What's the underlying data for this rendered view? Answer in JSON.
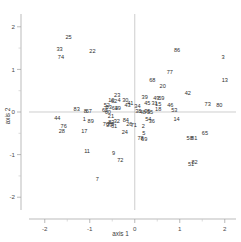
{
  "chart_data": {
    "type": "scatter",
    "title": "",
    "subtitle": "",
    "xlabel": "axis 1",
    "ylabel": "axis 2",
    "xlim": [
      -2.35,
      2.25
    ],
    "ylim": [
      -2.3,
      2.3
    ],
    "xticks": [
      -2,
      -1,
      0,
      1,
      2
    ],
    "xticklabels": [
      "-2",
      "-1",
      "0",
      "1",
      "2"
    ],
    "yticks": [
      -2,
      -1,
      0,
      1,
      2
    ],
    "yticklabels": [
      "-2",
      "-1",
      "0",
      "1",
      "2"
    ],
    "grid": false,
    "legend": null,
    "marker": "text-label",
    "note": "Ordination-style scatter where each observation is drawn as its numeric id label; dense overlapping cluster near origin.",
    "points": [
      {
        "label": "25",
        "x": -1.47,
        "y": 1.76
      },
      {
        "label": "33",
        "x": -1.67,
        "y": 1.48
      },
      {
        "label": "74",
        "x": -1.64,
        "y": 1.29
      },
      {
        "label": "22",
        "x": -0.94,
        "y": 1.44
      },
      {
        "label": "86",
        "x": 0.94,
        "y": 1.45
      },
      {
        "label": "3",
        "x": 1.96,
        "y": 1.3
      },
      {
        "label": "77",
        "x": 0.78,
        "y": 0.93
      },
      {
        "label": "13",
        "x": 2.0,
        "y": 0.76
      },
      {
        "label": "68",
        "x": 0.39,
        "y": 0.75
      },
      {
        "label": "20",
        "x": 0.62,
        "y": 0.6
      },
      {
        "label": "42",
        "x": 1.18,
        "y": 0.44
      },
      {
        "label": "23",
        "x": -0.39,
        "y": 0.4
      },
      {
        "label": "39",
        "x": 0.22,
        "y": 0.35
      },
      {
        "label": "49",
        "x": 0.48,
        "y": 0.34
      },
      {
        "label": "59",
        "x": 0.59,
        "y": 0.33
      },
      {
        "label": "10",
        "x": -0.52,
        "y": 0.27
      },
      {
        "label": "62",
        "x": -0.46,
        "y": 0.25
      },
      {
        "label": "4",
        "x": -0.35,
        "y": 0.28
      },
      {
        "label": "30",
        "x": -0.21,
        "y": 0.27
      },
      {
        "label": "41",
        "x": -0.1,
        "y": 0.22
      },
      {
        "label": "45",
        "x": 0.28,
        "y": 0.22
      },
      {
        "label": "31",
        "x": 0.44,
        "y": 0.21
      },
      {
        "label": "15",
        "x": 0.52,
        "y": 0.18
      },
      {
        "label": "46",
        "x": 0.79,
        "y": 0.17
      },
      {
        "label": "73",
        "x": 1.62,
        "y": 0.19
      },
      {
        "label": "80",
        "x": 1.88,
        "y": 0.16
      },
      {
        "label": "43",
        "x": -0.16,
        "y": 0.16
      },
      {
        "label": "34",
        "x": 0.06,
        "y": 0.13
      },
      {
        "label": "52",
        "x": -0.62,
        "y": 0.17
      },
      {
        "label": "63",
        "x": -0.58,
        "y": 0.11
      },
      {
        "label": "64",
        "x": -0.44,
        "y": 0.1
      },
      {
        "label": "19",
        "x": -0.38,
        "y": 0.09
      },
      {
        "label": "83",
        "x": -1.29,
        "y": 0.08
      },
      {
        "label": "8",
        "x": -1.1,
        "y": 0.03
      },
      {
        "label": "67",
        "x": -1.02,
        "y": 0.02
      },
      {
        "label": "60",
        "x": -0.6,
        "y": 0.0
      },
      {
        "label": "65x",
        "x": -0.66,
        "y": 0.04
      },
      {
        "label": "18",
        "x": 0.52,
        "y": 0.07
      },
      {
        "label": "53",
        "x": 0.88,
        "y": 0.05
      },
      {
        "label": "38",
        "x": 0.08,
        "y": 0.02
      },
      {
        "label": "48",
        "x": 0.18,
        "y": 0.01
      },
      {
        "label": "55",
        "x": 0.34,
        "y": 0.01
      },
      {
        "label": "35",
        "x": 0.28,
        "y": 0.03
      },
      {
        "label": "44",
        "x": -1.72,
        "y": -0.15
      },
      {
        "label": "1",
        "x": -1.12,
        "y": -0.17
      },
      {
        "label": "89",
        "x": -0.98,
        "y": -0.22
      },
      {
        "label": "21",
        "x": -0.53,
        "y": -0.1
      },
      {
        "label": "14",
        "x": 0.93,
        "y": -0.17
      },
      {
        "label": "84",
        "x": -0.2,
        "y": -0.18
      },
      {
        "label": "32",
        "x": -0.4,
        "y": -0.21
      },
      {
        "label": "83b",
        "x": -0.52,
        "y": -0.23
      },
      {
        "label": "70",
        "x": -0.64,
        "y": -0.27
      },
      {
        "label": "75",
        "x": -0.53,
        "y": -0.28
      },
      {
        "label": "37",
        "x": -0.57,
        "y": -0.31
      },
      {
        "label": "61",
        "x": -0.46,
        "y": -0.32
      },
      {
        "label": "36",
        "x": 0.38,
        "y": -0.22
      },
      {
        "label": "54",
        "x": 0.3,
        "y": -0.16
      },
      {
        "label": "26",
        "x": -0.12,
        "y": -0.28
      },
      {
        "label": "71",
        "x": -0.02,
        "y": -0.31
      },
      {
        "label": "2",
        "x": 0.19,
        "y": -0.34
      },
      {
        "label": "76",
        "x": -1.58,
        "y": -0.34
      },
      {
        "label": "28",
        "x": -1.62,
        "y": -0.45
      },
      {
        "label": "17",
        "x": -1.12,
        "y": -0.44
      },
      {
        "label": "24",
        "x": -0.22,
        "y": -0.48
      },
      {
        "label": "5",
        "x": 0.2,
        "y": -0.49
      },
      {
        "label": "78",
        "x": 0.13,
        "y": -0.62
      },
      {
        "label": "69",
        "x": 0.21,
        "y": -0.63
      },
      {
        "label": "65",
        "x": 1.56,
        "y": -0.49
      },
      {
        "label": "58",
        "x": 1.22,
        "y": -0.62
      },
      {
        "label": "81",
        "x": 1.32,
        "y": -0.6
      },
      {
        "label": "11",
        "x": -1.06,
        "y": -0.92
      },
      {
        "label": "9",
        "x": -0.47,
        "y": -0.96
      },
      {
        "label": "72",
        "x": -0.32,
        "y": -1.12
      },
      {
        "label": "51",
        "x": 1.25,
        "y": -1.22
      },
      {
        "label": "82",
        "x": 1.33,
        "y": -1.18
      },
      {
        "label": "7",
        "x": -0.83,
        "y": -1.58
      }
    ]
  }
}
